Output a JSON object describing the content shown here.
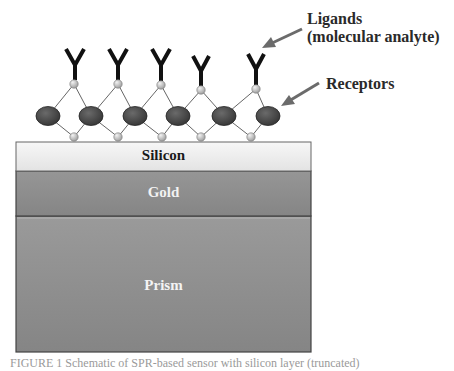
{
  "figure": {
    "labels": {
      "ligands_line1": "Ligands",
      "ligands_line2": "(molecular analyte)",
      "receptors": "Receptors"
    },
    "layers": [
      {
        "name": "Silicon",
        "top": 142,
        "bottom": 171,
        "fill": "#ececec",
        "text_color": "#1a1a1a"
      },
      {
        "name": "Gold",
        "top": 171,
        "bottom": 216,
        "fill": "#8c8c8c",
        "text_color": "#f2f2f2"
      },
      {
        "name": "Prism",
        "top": 216,
        "bottom": 352,
        "fill": "#8f8f8f",
        "text_color": "#f4f4f4"
      }
    ],
    "ligand_count": 6,
    "receptor_count": 6,
    "caption": "FIGURE 1 Schematic of SPR-based sensor with silicon layer (truncated)",
    "colors": {
      "ligand": "#111111",
      "receptor": "#4a4a4a",
      "node": "#bdbdbd",
      "bond": "#666666",
      "arrow": "#6b6b6b"
    }
  }
}
